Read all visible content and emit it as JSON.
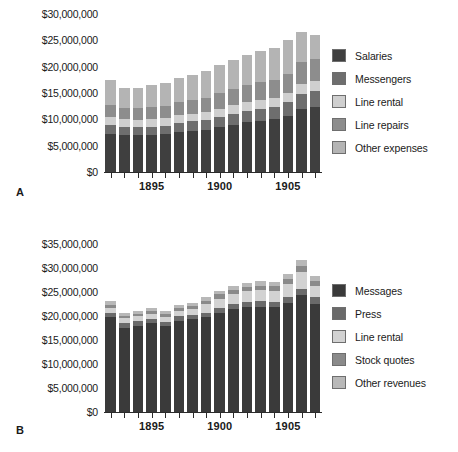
{
  "panels": [
    {
      "letter": "A",
      "legend": [
        {
          "label": "Salaries",
          "color": "#3f3f3f"
        },
        {
          "label": "Messengers",
          "color": "#6e6e6e"
        },
        {
          "label": "Line rental",
          "color": "#cfcfcf"
        },
        {
          "label": "Line repairs",
          "color": "#8d8d8d"
        },
        {
          "label": "Other expenses",
          "color": "#b4b4b4"
        }
      ],
      "ytick_labels": [
        "$0",
        "$5,000,000",
        "$10,000,000",
        "$15,000,000",
        "$20,000,000",
        "$25,000,000",
        "$30,000,000"
      ],
      "xtick_labels": [
        "1895",
        "1900",
        "1905"
      ]
    },
    {
      "letter": "B",
      "legend": [
        {
          "label": "Messages",
          "color": "#3a3a3a"
        },
        {
          "label": "Press",
          "color": "#6a6a6a"
        },
        {
          "label": "Line rental",
          "color": "#d2d2d2"
        },
        {
          "label": "Stock quotes",
          "color": "#8a8a8a"
        },
        {
          "label": "Other revenues",
          "color": "#b8b8b8"
        }
      ],
      "ytick_labels": [
        "$0",
        "$5,000,000",
        "$10,000,000",
        "$15,000,000",
        "$20,000,000",
        "$25,000,000",
        "$30,000,000",
        "$35,000,000"
      ],
      "xtick_labels": [
        "1895",
        "1900",
        "1905"
      ]
    }
  ],
  "chart_data": [
    {
      "type": "bar",
      "subtype": "stacked",
      "title": "A",
      "xlabel": "",
      "ylabel": "",
      "ylim": [
        0,
        30000000
      ],
      "ytick_values": [
        0,
        5000000,
        10000000,
        15000000,
        20000000,
        25000000,
        30000000
      ],
      "grid": false,
      "legend_position": "right",
      "categories": [
        1892,
        1893,
        1894,
        1895,
        1896,
        1897,
        1898,
        1899,
        1900,
        1901,
        1902,
        1903,
        1904,
        1905,
        1906,
        1907
      ],
      "xtick_labeled": [
        1895,
        1900,
        1905
      ],
      "series": [
        {
          "name": "Salaries",
          "color": "#3f3f3f",
          "values": [
            7300000,
            7100000,
            7000000,
            7100000,
            7200000,
            7600000,
            7800000,
            8000000,
            8500000,
            9000000,
            9400000,
            9700000,
            10000000,
            10600000,
            12000000,
            12400000
          ]
        },
        {
          "name": "Messengers",
          "color": "#6e6e6e",
          "values": [
            1600000,
            1500000,
            1500000,
            1500000,
            1600000,
            1700000,
            1800000,
            1900000,
            2000000,
            2100000,
            2200000,
            2300000,
            2400000,
            2600000,
            2900000,
            3000000
          ]
        },
        {
          "name": "Line rental",
          "color": "#cfcfcf",
          "values": [
            1500000,
            1400000,
            1400000,
            1400000,
            1400000,
            1450000,
            1500000,
            1500000,
            1550000,
            1600000,
            1650000,
            1700000,
            1750000,
            1800000,
            1900000,
            1950000
          ]
        },
        {
          "name": "Line repairs",
          "color": "#8d8d8d",
          "values": [
            2400000,
            2200000,
            2200000,
            2300000,
            2400000,
            2500000,
            2600000,
            2700000,
            2900000,
            3000000,
            3200000,
            3300000,
            3400000,
            3600000,
            4000000,
            4100000
          ]
        },
        {
          "name": "Other expenses",
          "color": "#b4b4b4",
          "values": [
            4600000,
            3800000,
            3900000,
            4200000,
            4400000,
            4600000,
            4800000,
            5100000,
            5400000,
            5600000,
            5800000,
            5900000,
            6050000,
            6400000,
            5700000,
            4550000
          ]
        }
      ],
      "totals": [
        17400000,
        16000000,
        16000000,
        16500000,
        17000000,
        17850000,
        18500000,
        19200000,
        20350000,
        21300000,
        22250000,
        22900000,
        23600000,
        25000000,
        26500000,
        26000000
      ]
    },
    {
      "type": "bar",
      "subtype": "stacked",
      "title": "B",
      "xlabel": "",
      "ylabel": "",
      "ylim": [
        0,
        35000000
      ],
      "ytick_values": [
        0,
        5000000,
        10000000,
        15000000,
        20000000,
        25000000,
        30000000,
        35000000
      ],
      "grid": false,
      "legend_position": "right",
      "categories": [
        1892,
        1893,
        1894,
        1895,
        1896,
        1897,
        1898,
        1899,
        1900,
        1901,
        1902,
        1903,
        1904,
        1905,
        1906,
        1907
      ],
      "xtick_labeled": [
        1895,
        1900,
        1905
      ],
      "series": [
        {
          "name": "Messages",
          "color": "#3a3a3a",
          "values": [
            19700000,
            17600000,
            18000000,
            18500000,
            17900000,
            19000000,
            19300000,
            19700000,
            20700000,
            21400000,
            21800000,
            21900000,
            21800000,
            22800000,
            24300000,
            22600000
          ]
        },
        {
          "name": "Press",
          "color": "#6a6a6a",
          "values": [
            900000,
            900000,
            900000,
            900000,
            900000,
            950000,
            950000,
            1000000,
            1050000,
            1100000,
            1150000,
            1150000,
            1200000,
            1250000,
            1350000,
            1300000
          ]
        },
        {
          "name": "Line rental",
          "color": "#d2d2d2",
          "values": [
            1100000,
            1000000,
            1000000,
            1000000,
            1000000,
            1100000,
            1150000,
            1700000,
            1900000,
            2100000,
            2200000,
            2300000,
            2200000,
            2600000,
            3500000,
            2300000
          ]
        },
        {
          "name": "Stock quotes",
          "color": "#8a8a8a",
          "values": [
            700000,
            600000,
            600000,
            650000,
            650000,
            700000,
            750000,
            800000,
            850000,
            900000,
            950000,
            1000000,
            1050000,
            1150000,
            1300000,
            1200000
          ]
        },
        {
          "name": "Other revenues",
          "color": "#b8b8b8",
          "values": [
            700000,
            500000,
            500000,
            550000,
            550000,
            600000,
            650000,
            700000,
            750000,
            800000,
            850000,
            900000,
            900000,
            1000000,
            1150000,
            1000000
          ]
        }
      ],
      "totals": [
        23100000,
        20600000,
        21000000,
        21600000,
        21000000,
        22350000,
        22800000,
        23900000,
        25250000,
        26300000,
        26950000,
        27250000,
        27150000,
        28800000,
        31600000,
        28400000
      ]
    }
  ]
}
